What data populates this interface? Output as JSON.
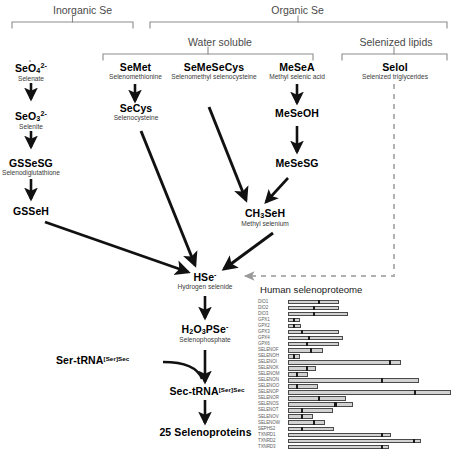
{
  "groups": {
    "top": [
      {
        "label": "Inorganic Se"
      },
      {
        "label": "Organic Se"
      }
    ],
    "second": [
      {
        "label": "Water soluble"
      },
      {
        "label": "Selenized lipids"
      }
    ]
  },
  "nodes": {
    "seo4": {
      "name": "SeO4 2-",
      "sub": "Selenate"
    },
    "seo3": {
      "name": "SeO3 2-",
      "sub": "Selenite"
    },
    "gssesg": {
      "name": "GSSeSG",
      "sub": "Selenodiglutathione"
    },
    "gsseh": {
      "name": "GSSeH",
      "sub": ""
    },
    "semet": {
      "name": "SeMet",
      "sub": "Selenomethionine"
    },
    "secys": {
      "name": "SeCys",
      "sub": "Selenocysteine"
    },
    "semesecys": {
      "name": "SeMeSeCys",
      "sub": "Selenomethyl selenocysteine"
    },
    "mesea": {
      "name": "MeSeA",
      "sub": "Methyl selenic acid"
    },
    "meseoh": {
      "name": "MeSeOH",
      "sub": ""
    },
    "mesesg": {
      "name": "MeSeSG",
      "sub": ""
    },
    "ch3seh": {
      "name": "CH3SeH",
      "sub": "Methyl selenium"
    },
    "selol": {
      "name": "Selol",
      "sub": "Selenized triglycerides"
    },
    "hse": {
      "name": "HSe-",
      "sub": "Hydrogen selenide"
    },
    "h2o3pse": {
      "name": "H2O3PSe-",
      "sub": "Selenophosphate"
    },
    "sertrna": {
      "name": "Ser-tRNA",
      "sup": "[Ser]Sec",
      "sub": ""
    },
    "sectrna": {
      "name": "Sec-tRNA",
      "sup": "[Ser]Sec",
      "sub": ""
    },
    "selenoproteins": {
      "name": "25 Selenoproteins",
      "sub": ""
    }
  },
  "selenoproteome": {
    "title": "Human selenoproteome"
  },
  "chart_data": {
    "type": "bar",
    "title": "Human selenoproteome",
    "xlabel": "",
    "ylabel": "",
    "grid": false,
    "legend": "none",
    "categories": [
      "DIO1",
      "DIO2",
      "DIO3",
      "GPX1",
      "GPX2",
      "GPX3",
      "GPX4",
      "GPX6",
      "SELENOF",
      "SELENOH",
      "SELENOI",
      "SELENOK",
      "SELENOM",
      "SELENON",
      "SELENOO",
      "SELENOP",
      "SELENOR",
      "SELENOS",
      "SELENOT",
      "SELENOV",
      "SELENOW",
      "SEPHS2",
      "TXNRD1",
      "TXNRD2",
      "TXNRD3"
    ],
    "series": [
      {
        "name": "range",
        "values": [
          62,
          62,
          72,
          14,
          16,
          62,
          66,
          62,
          42,
          14,
          136,
          34,
          24,
          158,
          36,
          196,
          70,
          78,
          54,
          30,
          44,
          56,
          124,
          160,
          122
        ]
      },
      {
        "name": "marker",
        "values": [
          36,
          30,
          30,
          6,
          6,
          16,
          24,
          22,
          26,
          6,
          122,
          22,
          10,
          112,
          10,
          152,
          36,
          56,
          16,
          16,
          30,
          16,
          112,
          150,
          112
        ]
      }
    ]
  }
}
